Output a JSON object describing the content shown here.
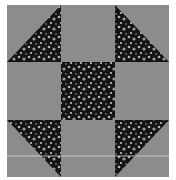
{
  "image": {
    "subject": "Shoo-fly quilt block",
    "grid": "3x3",
    "colors": {
      "solid": "#8c8c8c",
      "print_dark": "#141414",
      "print_speck": "#b0b0b0",
      "seam_line": "#d8d8d8"
    },
    "cells": [
      {
        "row": 0,
        "col": 0,
        "type": "half-square-triangle",
        "dark_corner": "bottom-right"
      },
      {
        "row": 0,
        "col": 1,
        "type": "solid"
      },
      {
        "row": 0,
        "col": 2,
        "type": "half-square-triangle",
        "dark_corner": "bottom-left"
      },
      {
        "row": 1,
        "col": 0,
        "type": "solid"
      },
      {
        "row": 1,
        "col": 1,
        "type": "print"
      },
      {
        "row": 1,
        "col": 2,
        "type": "solid"
      },
      {
        "row": 2,
        "col": 0,
        "type": "half-square-triangle",
        "dark_corner": "top-right"
      },
      {
        "row": 2,
        "col": 1,
        "type": "solid"
      },
      {
        "row": 2,
        "col": 2,
        "type": "half-square-triangle",
        "dark_corner": "top-left"
      }
    ]
  }
}
